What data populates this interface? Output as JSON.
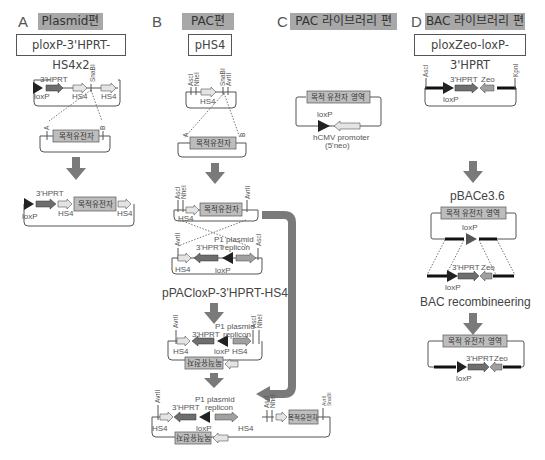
{
  "panels": [
    {
      "letter": "A",
      "title": "Plasmid편",
      "construct": "ploxP-3'HPRT-HS4x2"
    },
    {
      "letter": "B",
      "title": "PAC편",
      "construct": "pHS4"
    },
    {
      "letter": "C",
      "title": "PAC 라이브러리 편"
    },
    {
      "letter": "D",
      "title": "BAC 라이브러리 편",
      "construct": "ploxZeo-loxP-3'HPRT"
    }
  ],
  "labels": {
    "loxP": "loxP",
    "hprt": "3'HPRT",
    "hs4": "HS4",
    "snabi": "SnaBI",
    "avrii": "AvrII",
    "asci": "AscI",
    "nhei": "NheI",
    "kpni": "KpnI",
    "zeo": "Zeo",
    "site_a": "A",
    "site_b": "B",
    "target_gene": "목적유전자",
    "target_gene_reverse": "목적유전자",
    "target_region": "목적 유전자 영역",
    "p1_plasmid": "P1 plasmid",
    "replicon": "replicon",
    "hcmv": "hCMV promoter",
    "neo": "(5'neo)",
    "pac_vector_name": "pPACloxP-3'HPRT-HS4",
    "bac_vector_name": "pBACe3.6",
    "bac_recombineering": "BAC recombineering"
  },
  "colors": {
    "title_bg": "#a8a8a8",
    "arrow": "#7a7a7a",
    "hprt": "#6e6e6e",
    "hs4": "#e4e4e4",
    "gene_box": "#bdbdbd",
    "loxp": "#222222",
    "bac_arm": "#111111"
  }
}
